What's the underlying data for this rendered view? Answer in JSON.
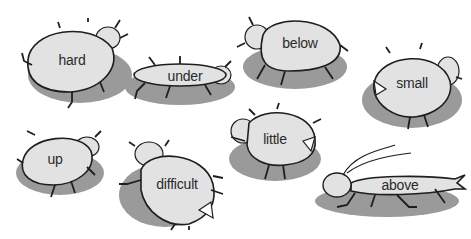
{
  "colors": {
    "background": "#ffffff",
    "shadow": "#9a9a9a",
    "body_fill": "#e2e2e2",
    "outline": "#1e1e1e",
    "text": "#2a2a2a"
  },
  "bugs": [
    {
      "word": "hard",
      "shape": "round-beetle",
      "x": 20,
      "y": 20,
      "w": 105,
      "h": 85
    },
    {
      "word": "under",
      "shape": "flat-bug",
      "x": 125,
      "y": 55,
      "w": 110,
      "h": 50
    },
    {
      "word": "below",
      "shape": "round-beetle",
      "x": 235,
      "y": 15,
      "w": 115,
      "h": 75
    },
    {
      "word": "small",
      "shape": "chomper",
      "x": 360,
      "y": 45,
      "w": 105,
      "h": 85
    },
    {
      "word": "up",
      "shape": "round-beetle",
      "x": 15,
      "y": 125,
      "w": 90,
      "h": 75
    },
    {
      "word": "difficult",
      "shape": "chomper",
      "x": 115,
      "y": 140,
      "w": 110,
      "h": 90
    },
    {
      "word": "little",
      "shape": "chomper",
      "x": 225,
      "y": 105,
      "w": 100,
      "h": 80
    },
    {
      "word": "above",
      "shape": "cricket",
      "x": 315,
      "y": 145,
      "w": 150,
      "h": 75
    }
  ]
}
